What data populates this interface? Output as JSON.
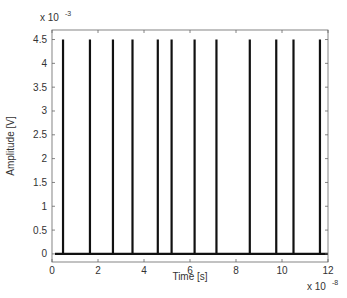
{
  "chart_data": {
    "type": "line",
    "title": "",
    "xlabel": "Time [s]",
    "ylabel": "Amplitude [V]",
    "x_multiplier": "x 10",
    "x_multiplier_exp": "-8",
    "y_multiplier": "x 10",
    "y_multiplier_exp": "-3",
    "xlim": [
      0,
      12
    ],
    "ylim": [
      -0.17,
      4.7
    ],
    "xticks": [
      0,
      2,
      4,
      6,
      8,
      10,
      12
    ],
    "xtick_labels": [
      "0",
      "2",
      "4",
      "6",
      "8",
      "10",
      "12"
    ],
    "yticks": [
      0,
      0.5,
      1,
      1.5,
      2,
      2.5,
      3,
      3.5,
      4,
      4.5
    ],
    "ytick_labels": [
      "0",
      "0.5",
      "1",
      "1.5",
      "2",
      "2.5",
      "3",
      "3.5",
      "4",
      "4.5"
    ],
    "grid": false,
    "legend": null,
    "series": [
      {
        "name": "pulse train",
        "color": "#000000",
        "baseline": 0,
        "pulse_amplitude": 4.5,
        "pulse_times": [
          0.48,
          1.65,
          2.65,
          3.5,
          4.6,
          5.2,
          6.2,
          7.15,
          8.6,
          9.75,
          10.5,
          11.65
        ]
      }
    ]
  },
  "colors": {
    "axis": "#666666",
    "line": "#111111",
    "background": "#ffffff"
  }
}
